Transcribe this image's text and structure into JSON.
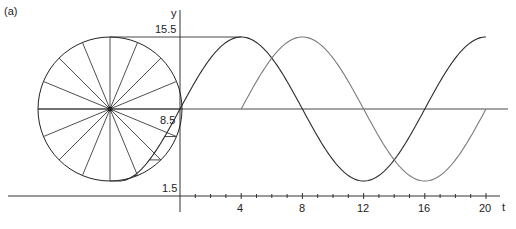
{
  "panel_label": "(a)",
  "axes": {
    "y_label": "y",
    "x_label": "t",
    "y_ticks": [
      "15.5",
      "8.5",
      "1.5"
    ],
    "x_ticks": [
      "4",
      "8",
      "12",
      "16",
      "20"
    ]
  },
  "colors": {
    "axis": "#333333",
    "curve_primary": "#2a2a2a",
    "curve_secondary": "#7a7a7a",
    "circle": "#222222"
  },
  "chart_data": {
    "type": "line",
    "title": "",
    "panel": "(a)",
    "xlabel": "t",
    "ylabel": "y",
    "xlim": [
      0,
      21
    ],
    "ylim": [
      1.5,
      15.5
    ],
    "x_ticks": [
      4,
      8,
      12,
      16,
      20
    ],
    "x_minor_tick_step": 1,
    "y_ticks": [
      1.5,
      8.5,
      15.5
    ],
    "grid": false,
    "annotations": [
      "Reference circle (16 spokes) centered at y = 8.5, radius 7, projecting onto the y axis",
      "Horizontal projection lines from circle to the first curve at y = 15.5, 8.5 and below-center points",
      "Horizontal midline at y = 8.5 extending across plot"
    ],
    "series": [
      {
        "name": "y = 8.5 + 7 sin(2πt/16)",
        "x": [
          0,
          2,
          4,
          6,
          8,
          10,
          12,
          14,
          16,
          18,
          20
        ],
        "values": [
          8.5,
          13.45,
          15.5,
          13.45,
          8.5,
          3.55,
          1.5,
          3.55,
          8.5,
          13.45,
          15.5
        ]
      },
      {
        "name": "y = 8.5 + 7 sin(2π(t−4)/16)",
        "x": [
          4,
          6,
          8,
          10,
          12,
          14,
          16,
          18,
          20
        ],
        "values": [
          8.5,
          13.45,
          15.5,
          13.45,
          8.5,
          3.55,
          1.5,
          3.55,
          8.5
        ]
      }
    ]
  }
}
